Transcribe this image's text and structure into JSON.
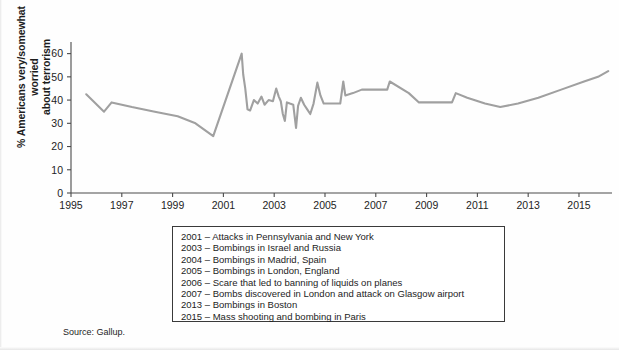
{
  "figure": {
    "source_note": "Source: Gallup.",
    "ylabel": "% Americans very/somewhat worried\nabout terrorism"
  },
  "legend": {
    "entries": [
      "2001 – Attacks in Pennsylvania and New York",
      "2003 – Bombings in Israel and Russia",
      "2004 – Bombings in Madrid, Spain",
      "2005 – Bombings in London, England",
      "2006 – Scare that led to banning of liquids on planes",
      "2007 – Bombs discovered in London and attack on Glasgow airport",
      "2013 – Bombings in Boston",
      "2015 – Mass shooting and bombing in Paris"
    ]
  },
  "colors": {
    "line": "#a0a0a0",
    "axis": "#4a4a4a",
    "text": "#1d1d1d",
    "legend_border": "#3a3a3a",
    "background": "#fefefe"
  },
  "chart_data": {
    "type": "line",
    "title": "",
    "subtitle": "",
    "xlabel": "",
    "ylabel": "% Americans very/somewhat worried about terrorism",
    "xlim": [
      1995,
      2016.3
    ],
    "ylim": [
      0,
      65
    ],
    "yticks": [
      0,
      10,
      20,
      30,
      40,
      50,
      60
    ],
    "xticks": [
      1995,
      1997,
      1999,
      2001,
      2003,
      2005,
      2007,
      2009,
      2011,
      2013,
      2015
    ],
    "grid": false,
    "legend_position": "below-plot-boxed",
    "series": [
      {
        "name": "% Americans very/somewhat worried about terrorism",
        "color": "#a0a0a0",
        "x": [
          1995.6,
          1996.3,
          1996.6,
          1997.4,
          1998.3,
          1999.2,
          1999.9,
          2000.6,
          2001.72,
          2001.78,
          2001.86,
          2001.95,
          2002.05,
          2002.2,
          2002.35,
          2002.5,
          2002.62,
          2002.78,
          2002.95,
          2003.08,
          2003.18,
          2003.26,
          2003.34,
          2003.42,
          2003.5,
          2003.62,
          2003.75,
          2003.86,
          2003.94,
          2004.05,
          2004.18,
          2004.3,
          2004.42,
          2004.55,
          2004.7,
          2004.82,
          2004.95,
          2005.3,
          2005.6,
          2005.72,
          2005.8,
          2006.1,
          2006.45,
          2006.9,
          2007.3,
          2007.45,
          2007.55,
          2008.3,
          2008.7,
          2009.3,
          2009.9,
          2010.0,
          2010.15,
          2010.6,
          2011.3,
          2011.9,
          2012.6,
          2013.4,
          2014.3,
          2015.2,
          2015.75,
          2016.15
        ],
        "y": [
          42.5,
          35.0,
          39.0,
          37.0,
          35.0,
          33.0,
          30.0,
          24.5,
          60.0,
          51.0,
          45.0,
          36.0,
          35.5,
          40.0,
          38.5,
          41.5,
          38.0,
          40.0,
          39.5,
          45.0,
          41.5,
          39.5,
          34.0,
          31.0,
          39.0,
          38.5,
          38.0,
          28.0,
          37.5,
          41.0,
          38.0,
          36.0,
          34.0,
          38.5,
          47.5,
          42.0,
          38.5,
          38.5,
          38.5,
          48.0,
          42.0,
          43.0,
          44.5,
          44.5,
          44.5,
          44.5,
          48.0,
          43.0,
          39.0,
          39.0,
          39.0,
          39.0,
          43.0,
          41.0,
          38.5,
          37.0,
          38.5,
          41.0,
          44.5,
          48.0,
          50.0,
          52.5
        ]
      }
    ],
    "annotations": [
      "2001 – Attacks in Pennsylvania and New York",
      "2003 – Bombings in Israel and Russia",
      "2004 – Bombings in Madrid, Spain",
      "2005 – Bombings in London, England",
      "2006 – Scare that led to banning of liquids on planes",
      "2007 – Bombs discovered in London and attack on Glasgow airport",
      "2013 – Bombings in Boston",
      "2015 – Mass shooting and bombing in Paris"
    ]
  }
}
